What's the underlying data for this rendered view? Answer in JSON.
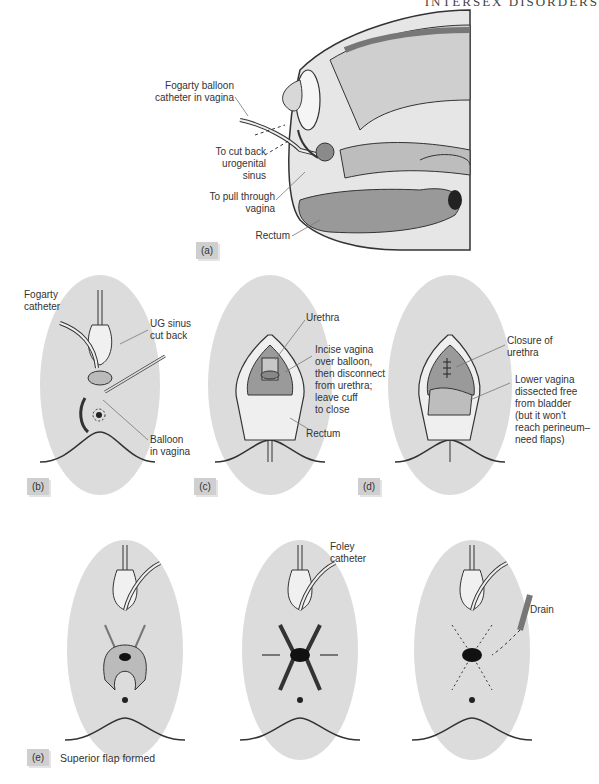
{
  "header": {
    "running_title": "INTERSEX DISORDERS"
  },
  "panels": {
    "a": {
      "tag": "(a)",
      "labels": {
        "balloon_catheter_1": "Fogarty balloon",
        "balloon_catheter_2": "catheter in vagina",
        "cut_back_1": "To cut back",
        "cut_back_2": "urogenital",
        "cut_back_3": "sinus",
        "pull_through_1": "To pull through",
        "pull_through_2": "vagina",
        "rectum": "Rectum"
      }
    },
    "b": {
      "tag": "(b)",
      "labels": {
        "fogarty_1": "Fogarty",
        "fogarty_2": "catheter",
        "ug_1": "UG sinus",
        "ug_2": "cut back",
        "balloon_1": "Balloon",
        "balloon_2": "in vagina"
      }
    },
    "c": {
      "tag": "(c)",
      "labels": {
        "urethra": "Urethra",
        "incise_1": "Incise vagina",
        "incise_2": "over balloon,",
        "incise_3": "then disconnect",
        "incise_4": "from urethra;",
        "incise_5": "leave cuff",
        "incise_6": "to close",
        "rectum": "Rectum"
      }
    },
    "d": {
      "tag": "(d)",
      "labels": {
        "closure_1": "Closure of",
        "closure_2": "urethra",
        "lower_1": "Lower vagina",
        "lower_2": "dissected free",
        "lower_3": "from bladder",
        "lower_4": "(but it won't",
        "lower_5": "reach perineum–",
        "lower_6": "need flaps)"
      }
    },
    "e": {
      "tag": "(e)",
      "caption": "Superior flap formed",
      "labels": {
        "foley_1": "Foley",
        "foley_2": "catheter",
        "drain": "Drain"
      }
    }
  },
  "colors": {
    "skin": "#dcdcdc",
    "tissue": "#a8a8a8",
    "dark": "#222222",
    "line": "#555555"
  }
}
